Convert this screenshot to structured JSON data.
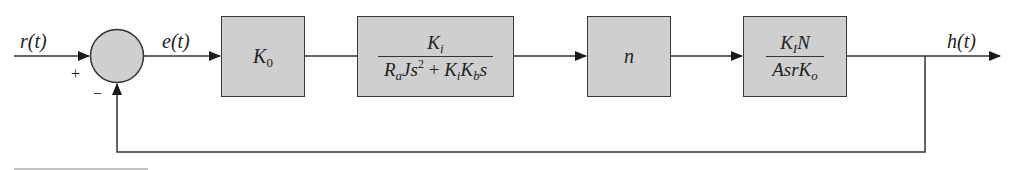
{
  "diagram": {
    "type": "closed-loop feedback block diagram",
    "signals": {
      "input": "r(t)",
      "error": "e(t)",
      "output": "h(t)"
    },
    "summing_junction": {
      "plus_sign": "+",
      "minus_sign": "−"
    },
    "blocks": [
      {
        "id": "k0",
        "label_main": "K",
        "label_sub": "0"
      },
      {
        "id": "motor",
        "numerator": {
          "main": "K",
          "sub": "i"
        },
        "denominator": {
          "t1": "R",
          "t1_sub": "a",
          "t2": "Js",
          "t2_sup": "2",
          "plus": " + ",
          "t3": "K",
          "t3_sub": "i",
          "t4": "K",
          "t4_sub": "b",
          "t5": "s"
        }
      },
      {
        "id": "gear",
        "label_main": "n"
      },
      {
        "id": "tank",
        "numerator": {
          "a": "K",
          "a_sub": "I",
          "b": "N"
        },
        "denominator": {
          "a": "Asr",
          "b": "K",
          "b_sub": "o"
        }
      }
    ],
    "colors": {
      "block_fill": "#cfcfcf",
      "line": "#333333",
      "background": "#ffffff"
    }
  }
}
